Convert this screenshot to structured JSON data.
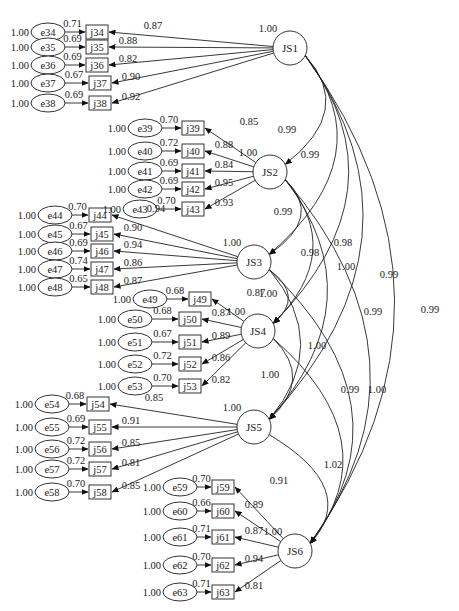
{
  "diagram": {
    "type": "SEM path diagram (second-order factor correlations)",
    "latents": [
      {
        "id": "JS1",
        "x": 290,
        "y": 48,
        "variance": "1.00"
      },
      {
        "id": "JS2",
        "x": 270,
        "y": 172,
        "variance": "1.00"
      },
      {
        "id": "JS3",
        "x": 254,
        "y": 262,
        "variance": "1.00"
      },
      {
        "id": "JS4",
        "x": 258,
        "y": 331,
        "variance": "1.00"
      },
      {
        "id": "JS5",
        "x": 254,
        "y": 427,
        "variance": "1.00"
      },
      {
        "id": "JS6",
        "x": 295,
        "y": 551,
        "variance": "1.00"
      }
    ],
    "indicators": [
      {
        "id": "j34",
        "err": "e34",
        "y": 32,
        "bx": 97,
        "ex": 48,
        "err_var": "1.00",
        "err_path": "0.71",
        "loading": "0.87",
        "factor": "JS1"
      },
      {
        "id": "j35",
        "err": "e35",
        "y": 47,
        "bx": 97,
        "ex": 48,
        "err_var": "1.00",
        "err_path": "0.69",
        "loading": "0.88",
        "factor": "JS1"
      },
      {
        "id": "j36",
        "err": "e36",
        "y": 65,
        "bx": 97,
        "ex": 48,
        "err_var": "1.00",
        "err_path": "0.69",
        "loading": "0.82",
        "factor": "JS1"
      },
      {
        "id": "j37",
        "err": "e37",
        "y": 83,
        "bx": 100,
        "ex": 48,
        "err_var": "1.00",
        "err_path": "0.67",
        "loading": "0.90",
        "factor": "JS1"
      },
      {
        "id": "j38",
        "err": "e38",
        "y": 103,
        "bx": 100,
        "ex": 48,
        "err_var": "1.00",
        "err_path": "0.69",
        "loading": "0.92",
        "factor": "JS1"
      },
      {
        "id": "j39",
        "err": "e39",
        "y": 128,
        "bx": 193,
        "ex": 145,
        "err_var": "1.00",
        "err_path": "0.70",
        "loading": "0.85",
        "factor": "JS2"
      },
      {
        "id": "j40",
        "err": "e40",
        "y": 151,
        "bx": 193,
        "ex": 145,
        "err_var": "1.00",
        "err_path": "0.72",
        "loading": "0.88",
        "factor": "JS2"
      },
      {
        "id": "j41",
        "err": "e41",
        "y": 171,
        "bx": 193,
        "ex": 145,
        "err_var": "1.00",
        "err_path": "0.69",
        "loading": "0.84",
        "factor": "JS2"
      },
      {
        "id": "j42",
        "err": "e42",
        "y": 189,
        "bx": 193,
        "ex": 145,
        "err_var": "1.00",
        "err_path": "0.69",
        "loading": "0.95",
        "factor": "JS2"
      },
      {
        "id": "j43",
        "err": "e43",
        "y": 209,
        "bx": 193,
        "ex": 140,
        "err_var": "1.00",
        "err_path": "0.70",
        "loading": "0.93",
        "factor": "JS2"
      },
      {
        "id": "j44",
        "err": "e44",
        "y": 215,
        "bx": 100,
        "ex": 55,
        "err_var": "1.00",
        "err_path": "0.70",
        "loading": "0.94",
        "factor": "JS3"
      },
      {
        "id": "j45",
        "err": "e45",
        "y": 234,
        "bx": 102,
        "ex": 55,
        "err_var": "1.00",
        "err_path": "0.67",
        "loading": "0.90",
        "factor": "JS3"
      },
      {
        "id": "j46",
        "err": "e46",
        "y": 251,
        "bx": 102,
        "ex": 55,
        "err_var": "1.00",
        "err_path": "0.69",
        "loading": "0.94",
        "factor": "JS3"
      },
      {
        "id": "j47",
        "err": "e47",
        "y": 269,
        "bx": 102,
        "ex": 55,
        "err_var": "1.00",
        "err_path": "0.74",
        "loading": "0.86",
        "factor": "JS3"
      },
      {
        "id": "j48",
        "err": "e48",
        "y": 287,
        "bx": 102,
        "ex": 55,
        "err_var": "1.00",
        "err_path": "0.65",
        "loading": "0.87",
        "factor": "JS3"
      },
      {
        "id": "j49",
        "err": "e49",
        "y": 299,
        "bx": 200,
        "ex": 150,
        "err_var": "1.00",
        "err_path": "0.68",
        "loading": "0.87",
        "factor": "JS4"
      },
      {
        "id": "j50",
        "err": "e50",
        "y": 319,
        "bx": 190,
        "ex": 135,
        "err_var": "1.00",
        "err_path": "0.68",
        "loading": "0.87",
        "factor": "JS4"
      },
      {
        "id": "j51",
        "err": "e51",
        "y": 342,
        "bx": 190,
        "ex": 135,
        "err_var": "1.00",
        "err_path": "0.67",
        "loading": "0.89",
        "factor": "JS4"
      },
      {
        "id": "j52",
        "err": "e52",
        "y": 364,
        "bx": 190,
        "ex": 135,
        "err_var": "1.00",
        "err_path": "0.72",
        "loading": "0.86",
        "factor": "JS4"
      },
      {
        "id": "j53",
        "err": "e53",
        "y": 386,
        "bx": 190,
        "ex": 135,
        "err_var": "1.00",
        "err_path": "0.70",
        "loading": "0.82",
        "factor": "JS4"
      },
      {
        "id": "j54",
        "err": "e54",
        "y": 404,
        "bx": 98,
        "ex": 52,
        "err_var": "1.00",
        "err_path": "0.68",
        "loading": "0.85",
        "factor": "JS5"
      },
      {
        "id": "j55",
        "err": "e55",
        "y": 427,
        "bx": 100,
        "ex": 52,
        "err_var": "1.00",
        "err_path": "0.69",
        "loading": "0.91",
        "factor": "JS5"
      },
      {
        "id": "j56",
        "err": "e56",
        "y": 449,
        "bx": 100,
        "ex": 52,
        "err_var": "1.00",
        "err_path": "0.72",
        "loading": "0.85",
        "factor": "JS5"
      },
      {
        "id": "j57",
        "err": "e57",
        "y": 469,
        "bx": 100,
        "ex": 52,
        "err_var": "1.00",
        "err_path": "0.72",
        "loading": "0.81",
        "factor": "JS5"
      },
      {
        "id": "j58",
        "err": "e58",
        "y": 492,
        "bx": 100,
        "ex": 52,
        "err_var": "1.00",
        "err_path": "0.70",
        "loading": "0.85",
        "factor": "JS5"
      },
      {
        "id": "j59",
        "err": "e59",
        "y": 487,
        "bx": 223,
        "ex": 180,
        "err_var": "1.00",
        "err_path": "0.70",
        "loading": "0.91",
        "factor": "JS6"
      },
      {
        "id": "j60",
        "err": "e60",
        "y": 511,
        "bx": 223,
        "ex": 180,
        "err_var": "1.00",
        "err_path": "0.66",
        "loading": "0.89",
        "factor": "JS6"
      },
      {
        "id": "j61",
        "err": "e61",
        "y": 537,
        "bx": 223,
        "ex": 180,
        "err_var": "1.00",
        "err_path": "0.71",
        "loading": "0.87",
        "factor": "JS6"
      },
      {
        "id": "j62",
        "err": "e62",
        "y": 565,
        "bx": 223,
        "ex": 180,
        "err_var": "1.00",
        "err_path": "0.70",
        "loading": "0.94",
        "factor": "JS6"
      },
      {
        "id": "j63",
        "err": "e63",
        "y": 592,
        "bx": 223,
        "ex": 180,
        "err_var": "1.00",
        "err_path": "0.71",
        "loading": "0.81",
        "factor": "JS6"
      }
    ],
    "covariances": [
      {
        "from": "JS1",
        "to": "JS2",
        "value": "0.99",
        "lx": 287,
        "ly": 133
      },
      {
        "from": "JS1",
        "to": "JS3",
        "value": "0.99",
        "lx": 310,
        "ly": 158
      },
      {
        "from": "JS1",
        "to": "JS4",
        "value": "0.98",
        "lx": 343,
        "ly": 246
      },
      {
        "from": "JS1",
        "to": "JS5",
        "value": "0.99",
        "lx": 373,
        "ly": 315
      },
      {
        "from": "JS1",
        "to": "JS6",
        "value": "0.99",
        "lx": 430,
        "ly": 313
      },
      {
        "from": "JS2",
        "to": "JS3",
        "value": "0.99",
        "lx": 283,
        "ly": 215
      },
      {
        "from": "JS2",
        "to": "JS4",
        "value": "0.98",
        "lx": 310,
        "ly": 256
      },
      {
        "from": "JS2",
        "to": "JS5",
        "value": "1.00",
        "lx": 346,
        "ly": 270
      },
      {
        "from": "JS2",
        "to": "JS6",
        "value": "0.99",
        "lx": 389,
        "ly": 278
      },
      {
        "from": "JS3",
        "to": "JS4",
        "value": "1.00",
        "lx": 268,
        "ly": 297
      },
      {
        "from": "JS3",
        "to": "JS5",
        "value": "1.00",
        "lx": 317,
        "ly": 349
      },
      {
        "from": "JS3",
        "to": "JS6",
        "value": "1.00",
        "lx": 377,
        "ly": 393
      },
      {
        "from": "JS4",
        "to": "JS5",
        "value": "1.00",
        "lx": 270,
        "ly": 378
      },
      {
        "from": "JS4",
        "to": "JS6",
        "value": "0.99",
        "lx": 350,
        "ly": 393
      },
      {
        "from": "JS5",
        "to": "JS6",
        "value": "1.02",
        "lx": 333,
        "ly": 468
      }
    ]
  }
}
